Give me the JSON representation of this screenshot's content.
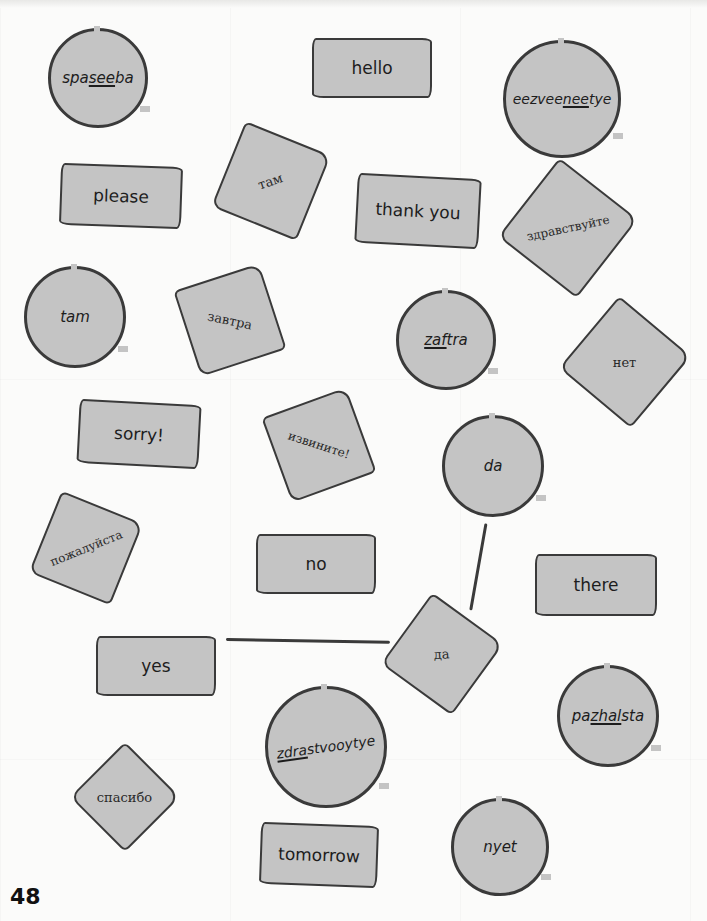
{
  "page": {
    "number": "48"
  },
  "cards": {
    "spaseeba": {
      "pre": "spa",
      "stress": "see",
      "post": "ba"
    },
    "hello": {
      "label": "hello"
    },
    "eezveeneetye": {
      "pre": "eezvee",
      "stress": "nee",
      "post": "tye"
    },
    "please": {
      "label": "please"
    },
    "tam_ru": {
      "label": "там"
    },
    "thank_you": {
      "label": "thank you"
    },
    "zdravstvuyte": {
      "label": "здравствуйте"
    },
    "tam": {
      "label": "tam"
    },
    "zavtra_ru": {
      "label": "завтра"
    },
    "zaftra": {
      "pre": "",
      "stress": "zaf",
      "post": "tra"
    },
    "net_ru": {
      "label": "нет"
    },
    "sorry": {
      "label": "sorry!"
    },
    "izvinite": {
      "label": "извините!"
    },
    "da": {
      "label": "da"
    },
    "pozhaluysta": {
      "label": "пожалуйста"
    },
    "no": {
      "label": "no"
    },
    "there": {
      "label": "there"
    },
    "yes": {
      "label": "yes"
    },
    "da_ru": {
      "label": "да"
    },
    "pazhalsta": {
      "pre": "pa",
      "stress": "zhal",
      "post": "sta"
    },
    "zdrastvooytye": {
      "pre": "",
      "stress": "zdra",
      "post": "stvooytye"
    },
    "spasibo": {
      "label": "спасибо"
    },
    "tomorrow": {
      "label": "tomorrow"
    },
    "nyet": {
      "label": "nyet"
    }
  },
  "matches": [
    {
      "from": "yes",
      "to": "да"
    },
    {
      "from": "da",
      "to": "да"
    }
  ],
  "colors": {
    "card_fill": "#c4c4c4",
    "outline": "#3a3a3a",
    "background": "#fbfbfa"
  }
}
